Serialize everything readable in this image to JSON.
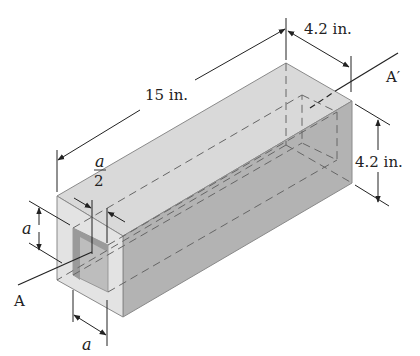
{
  "figure": {
    "colors": {
      "top_face": "#d9d9d9",
      "side_face": "#b3b3b3",
      "end_face": "#e3e3e3",
      "hole_inner": "#9a9a9a",
      "hole_floor": "#bdbdbd",
      "edge": "#8a8a8a",
      "line": "#222222"
    },
    "labels": {
      "length": "15 in.",
      "width": "4.2 in.",
      "height": "4.2 in.",
      "half_a_num": "a",
      "half_a_den": "2",
      "a_vertical": "a",
      "a_horizontal": "a",
      "axis_start": "A",
      "axis_end": "A′"
    }
  }
}
